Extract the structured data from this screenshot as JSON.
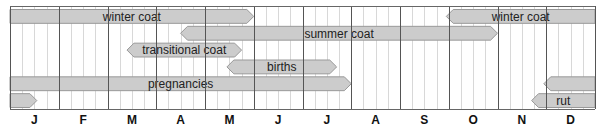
{
  "chart_data": {
    "type": "timeline",
    "title": "",
    "xlabel": "",
    "ylabel": "",
    "categories": [
      "J",
      "F",
      "M",
      "A",
      "M",
      "J",
      "J",
      "A",
      "S",
      "O",
      "N",
      "D"
    ],
    "x_unit": "month (0 = start of January, 12 = end of December)",
    "grid": {
      "month_lines": true,
      "minor_lines_per_month": 4
    },
    "rows": [
      {
        "row": 0,
        "bars": [
          {
            "label": "winter coat",
            "start": 0.0,
            "end": 5.0,
            "left_arrow": false,
            "right_arrow": true
          },
          {
            "label": "winter coat",
            "start": 8.95,
            "end": 12.0,
            "left_arrow": true,
            "right_arrow": false
          }
        ]
      },
      {
        "row": 1,
        "bars": [
          {
            "label": "summer coat",
            "start": 3.5,
            "end": 10.0,
            "left_arrow": true,
            "right_arrow": true
          }
        ]
      },
      {
        "row": 2,
        "bars": [
          {
            "label": "transitional coat",
            "start": 2.4,
            "end": 4.75,
            "left_arrow": true,
            "right_arrow": true
          }
        ]
      },
      {
        "row": 3,
        "bars": [
          {
            "label": "births",
            "start": 4.45,
            "end": 6.7,
            "left_arrow": true,
            "right_arrow": true
          }
        ]
      },
      {
        "row": 4,
        "bars": [
          {
            "label": "pregnancies",
            "start": 0.0,
            "end": 7.0,
            "left_arrow": false,
            "right_arrow": true
          },
          {
            "label": "",
            "start": 10.95,
            "end": 12.0,
            "left_arrow": true,
            "right_arrow": false
          }
        ]
      },
      {
        "row": 5,
        "bars": [
          {
            "label": "",
            "start": 0.0,
            "end": 0.55,
            "left_arrow": false,
            "right_arrow": true
          },
          {
            "label": "rut",
            "start": 10.7,
            "end": 12.0,
            "left_arrow": true,
            "right_arrow": false
          }
        ]
      }
    ]
  },
  "style": {
    "bar_fill": "#cccccc",
    "bar_stroke": "#999999",
    "month_line": "#555555",
    "minor_line": "#d8d8d8",
    "border": "#666666",
    "background": "#ffffff"
  }
}
